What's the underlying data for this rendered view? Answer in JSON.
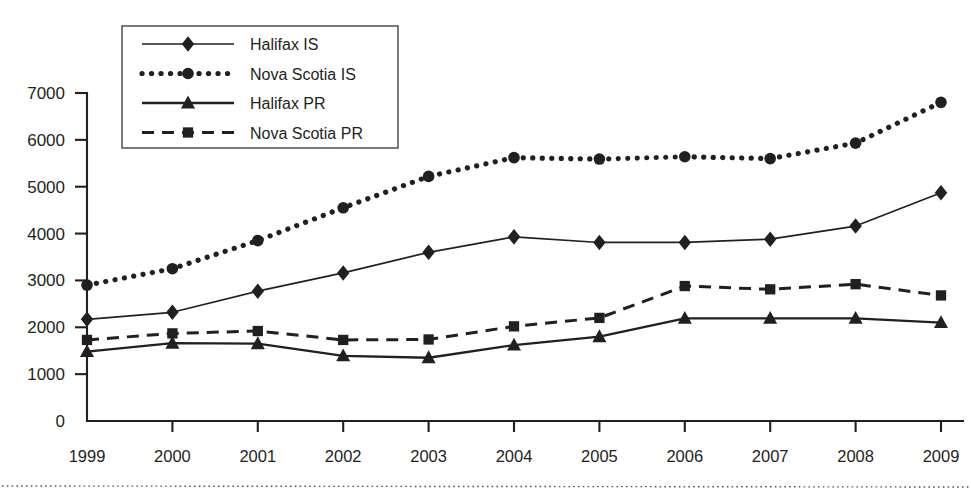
{
  "chart_data": {
    "type": "line",
    "title": "",
    "xlabel": "",
    "ylabel": "",
    "categories": [
      "1999",
      "2000",
      "2001",
      "2002",
      "2003",
      "2004",
      "2005",
      "2006",
      "2007",
      "2008",
      "2009"
    ],
    "x": [
      1999,
      2000,
      2001,
      2002,
      2003,
      2004,
      2005,
      2006,
      2007,
      2008,
      2009
    ],
    "ylim": [
      0,
      7000
    ],
    "yticks": [
      0,
      1000,
      2000,
      3000,
      4000,
      5000,
      6000,
      7000
    ],
    "ytick_labels": [
      "0",
      "1000",
      "2000",
      "3000",
      "4000",
      "5000",
      "6000",
      "7000"
    ],
    "grid": false,
    "legend_position": "top-left",
    "series": [
      {
        "name": "Halifax IS",
        "marker": "diamond",
        "line_style": "solid",
        "values": [
          2170,
          2320,
          2770,
          3160,
          3600,
          3930,
          3810,
          3810,
          3880,
          4160,
          4870
        ]
      },
      {
        "name": "Nova Scotia IS",
        "marker": "circle",
        "line_style": "dotted",
        "values": [
          2900,
          3250,
          3850,
          4550,
          5220,
          5620,
          5590,
          5640,
          5600,
          5930,
          6800
        ]
      },
      {
        "name": "Halifax PR",
        "marker": "triangle",
        "line_style": "solid",
        "values": [
          1480,
          1660,
          1650,
          1390,
          1350,
          1620,
          1800,
          2190,
          2190,
          2190,
          2100
        ]
      },
      {
        "name": "Nova Scotia PR",
        "marker": "square",
        "line_style": "dashed",
        "values": [
          1730,
          1870,
          1920,
          1730,
          1740,
          2020,
          2200,
          2880,
          2810,
          2920,
          2680
        ]
      }
    ]
  },
  "legend": {
    "entries": [
      {
        "label": "Halifax IS"
      },
      {
        "label": "Nova Scotia IS"
      },
      {
        "label": "Halifax PR"
      },
      {
        "label": "Nova Scotia PR"
      }
    ]
  },
  "colors": {
    "ink": "#231f20",
    "legend_border": "#5a5a5a",
    "background": "#ffffff"
  }
}
